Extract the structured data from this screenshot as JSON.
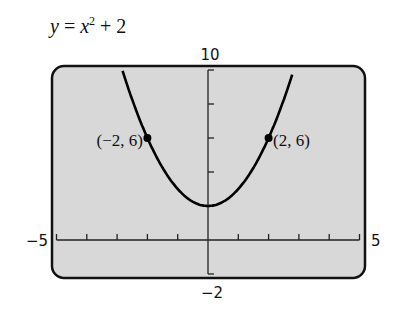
{
  "equation": {
    "lhs": "y",
    "op": " = ",
    "base": "x",
    "exp": "2",
    "rest": " + 2"
  },
  "axes": {
    "xmin_label": "−5",
    "xmax_label": "5",
    "ymax_label": "10",
    "ymin_label": "−2"
  },
  "points": [
    {
      "label": "(−2, 6)",
      "x": -2,
      "y": 6
    },
    {
      "label": "(2, 6)",
      "x": 2,
      "y": 6
    }
  ],
  "colors": {
    "frame_bg": "#d8d8d8",
    "ink": "#111111"
  },
  "chart_data": {
    "type": "line",
    "xlabel": "",
    "ylabel": "",
    "xlim": [
      -5,
      5
    ],
    "ylim": [
      -2,
      10
    ],
    "xticks_step": 1,
    "yticks_step": 2,
    "grid": false,
    "series": [
      {
        "name": "y = x^2 + 2",
        "x": [
          -2.8,
          -2.5,
          -2,
          -1.5,
          -1,
          -0.5,
          0,
          0.5,
          1,
          1.5,
          2,
          2.5,
          2.8
        ],
        "y": [
          9.84,
          8.25,
          6,
          4.25,
          3,
          2.25,
          2,
          2.25,
          3,
          4.25,
          6,
          8.25,
          9.84
        ]
      }
    ],
    "annotations": [
      {
        "text": "(-2, 6)",
        "x": -2,
        "y": 6
      },
      {
        "text": "(2, 6)",
        "x": 2,
        "y": 6
      }
    ]
  }
}
